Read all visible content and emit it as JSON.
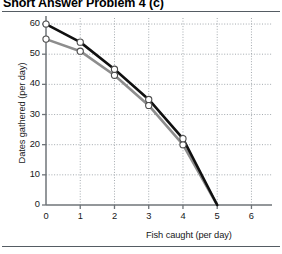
{
  "figure": {
    "title": "Short Answer Problem 4 (c)",
    "has_header_rule": true,
    "has_footer_rule": true
  },
  "chart_data": {
    "type": "line",
    "title": "Short Answer Problem 4 (c)",
    "subtitle": "",
    "xlabel": "Fish caught (per day)",
    "ylabel": "Dates gathered (per day)",
    "xlim": [
      0,
      6.6
    ],
    "ylim": [
      0,
      62
    ],
    "xticks": [
      0,
      1,
      2,
      3,
      4,
      5,
      6
    ],
    "xtick_labels": [
      "0",
      "1",
      "2",
      "3",
      "4",
      "5",
      "6"
    ],
    "yticks": [
      0,
      10,
      20,
      30,
      40,
      50,
      60
    ],
    "ytick_labels": [
      "0",
      "10",
      "20",
      "30",
      "40",
      "50",
      "60"
    ],
    "grid": true,
    "grid_style": "dotted",
    "grid_color": "#9aa0a6",
    "legend": false,
    "legend_position": "none",
    "marker": "open-circle",
    "marker_face_color": "#ffffff",
    "marker_edge_color": "#4d4d4d",
    "x": [
      0,
      1,
      2,
      3,
      4,
      5
    ],
    "series": [
      {
        "name": "Production possibilities frontier (outer)",
        "color": "#101010",
        "line_width": 2.6,
        "values": [
          60,
          54,
          45,
          35,
          22,
          0
        ]
      },
      {
        "name": "Production possibilities frontier (inner)",
        "color": "#8d8d8d",
        "line_width": 2.6,
        "values": [
          55,
          51,
          43,
          33,
          20,
          0
        ]
      }
    ],
    "annotations": []
  },
  "axes": {
    "y_title": "Dates gathered (per day)",
    "x_title": "Fish caught (per day)"
  }
}
